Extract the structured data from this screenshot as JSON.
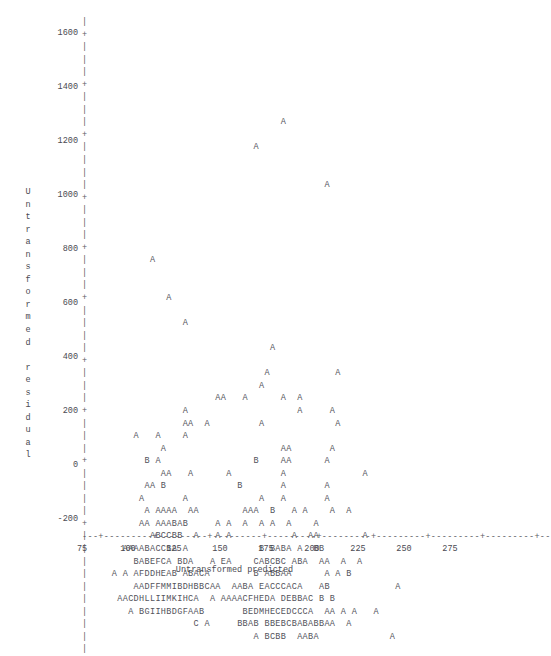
{
  "chart_data": {
    "type": "scatter",
    "title": "",
    "subtitle": "",
    "xlabel": "Untransformed predicted",
    "ylabel": "Untransformed residual",
    "grid": false,
    "legend": null,
    "annotations": [],
    "xlim": [
      62,
      288
    ],
    "ylim": [
      -260,
      1680
    ],
    "xticks": [
      75,
      100,
      125,
      150,
      175,
      200,
      225,
      250,
      275
    ],
    "yticks": [
      1600,
      1400,
      1200,
      1000,
      800,
      600,
      400,
      200,
      0,
      -200
    ],
    "x_tick_labels": [
      "75",
      "100",
      "125",
      "150",
      "175",
      "200",
      "225",
      "250",
      "275"
    ],
    "y_tick_labels": [
      "1600",
      "1400",
      "1200",
      "1000",
      "800",
      "600",
      "400",
      "200",
      "0",
      "-200"
    ],
    "point_symbols": [
      "A",
      "B",
      "C",
      "D",
      "E",
      "F",
      "G",
      "H",
      "I",
      "K",
      "M"
    ],
    "rows": [
      "                                                               ",
      "                                                               ",
      "                                                               ",
      "                                                               ",
      "                                                               ",
      "                                                               ",
      "                                                               ",
      "                                                               ",
      "                                   A                           ",
      "                                                               ",
      "                              A                                ",
      "                                                               ",
      "                                                               ",
      "                                           A                   ",
      "                                                               ",
      "                                                               ",
      "                                                               ",
      "                                                               ",
      "                                                               ",
      "           A                                                   ",
      "                                                               ",
      "                                                               ",
      "              A                                                ",
      "                                                               ",
      "                 A                                             ",
      "                                                               ",
      "                                 A                             ",
      "                                                               ",
      "                                A            A                 ",
      "                               A                               ",
      "                       AA   A      A  A                        ",
      "                 A                    A     A                  ",
      "                 AA  A         A             A                 ",
      "        A   A    A                                             ",
      "             A                     AA       A                  ",
      "          B A                 B    AA      A                   ",
      "             AA   A      A         A              A            ",
      "          AA B             B       A       A                   ",
      "         A       A             A   A       A                   ",
      "          A AAAA  AA        AAA  B   A A    A  A               ",
      "         AA AAABAB     A A  A  A A  A    A                     ",
      "           ABCCBB  A   A A           A  AA        A            ",
      "      AAAABACCBA A             B BABA A  BB                    ",
      "        BABEFCA BDA   A EA    CABCBC ABA  AA  A  A             ",
      "    A A AFDDHEAB ABACA        B ABBAA      A A B               ",
      "        AADFFMMIBDHBBCAA  AABA EACCCACA   AB            A      ",
      "     AACDHLLIIMKIHCA  A AAAACFHEDA DEBBAC B B                  ",
      "       A BGIIHBDGFAAB       BEDMHECEDCCCA  AA A A   A          ",
      "                   C A     BBAB BBEBCBABABBAA  A               ",
      "                              A BCBB  AABA             A       ",
      "                                                               "
    ]
  },
  "axes": {
    "y_axis_caption_chars": [
      "U",
      "n",
      "t",
      "r",
      "a",
      "n",
      "s",
      "f",
      "o",
      "r",
      "m",
      "e",
      "d",
      " ",
      "r",
      "e",
      "s",
      "i",
      "d",
      "u",
      "a",
      "l"
    ],
    "y_spine_glyph_tick": "+",
    "y_spine_glyph_line": "|",
    "x_spine_text": "---+---------+---------+---------+---------+---------+---------+---------+---------+--"
  }
}
